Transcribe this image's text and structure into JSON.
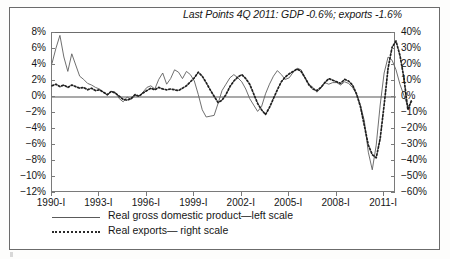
{
  "title": "Last Points 4Q 2011: GDP -0.6%; exports -1.6%",
  "legend": {
    "items": [
      {
        "label": "Real gross domestic product—left scale",
        "style": "solid"
      },
      {
        "label": "Real exports— right scale",
        "style": "dotted"
      }
    ]
  },
  "axes": {
    "left_ticks": [
      "8%",
      "6%",
      "4%",
      "2%",
      "0%",
      "-2%",
      "-4%",
      "-6%",
      "-8%",
      "-10%",
      "-12%"
    ],
    "right_ticks": [
      "40%",
      "30%",
      "20%",
      "10%",
      "0%",
      "-10%",
      "-20%",
      "-30%",
      "-40%",
      "-50%",
      "-60%"
    ],
    "x_ticks": [
      "1990-I",
      "1993-I",
      "1996-I",
      "1999-I",
      "2002-I",
      "2005-I",
      "2008-I",
      "2011-I"
    ]
  },
  "chart_data": {
    "type": "line",
    "title": "Last Points 4Q 2011: GDP -0.6%; exports -1.6%",
    "xlabel": "",
    "ylabel": "",
    "grid": false,
    "legend_position": "bottom-left",
    "x_tick_labels": [
      "1990-I",
      "1993-I",
      "1996-I",
      "1999-I",
      "2002-I",
      "2005-I",
      "2008-I",
      "2011-I"
    ],
    "x_tick_index": [
      0,
      12,
      24,
      36,
      48,
      60,
      72,
      84
    ],
    "x_start": "1990-I",
    "x_end": "2011-IV",
    "n_points": 88,
    "left_axis": {
      "label": "percent",
      "ylim": [
        -12,
        8
      ],
      "tick_step": 2,
      "tick_labels": [
        "8%",
        "6%",
        "4%",
        "2%",
        "0%",
        "-2%",
        "-4%",
        "-6%",
        "-8%",
        "-10%",
        "-12%"
      ]
    },
    "right_axis": {
      "label": "percent",
      "ylim": [
        -60,
        40
      ],
      "tick_step": 10,
      "tick_labels": [
        "40%",
        "30%",
        "20%",
        "10%",
        "0%",
        "-10%",
        "-20%",
        "-30%",
        "-40%",
        "-50%",
        "-60%"
      ]
    },
    "zero_line": 0,
    "annotations": [
      {
        "text": "Last Points 4Q 2011: GDP -0.6%; exports -1.6%",
        "position": "top-right"
      }
    ],
    "series": [
      {
        "name": "Real gross domestic product—left scale",
        "axis": "left",
        "style": "solid",
        "color": "#5a5a5a",
        "values": [
          4.2,
          6.1,
          7.7,
          5.0,
          3.2,
          5.4,
          4.0,
          2.6,
          2.2,
          1.7,
          1.5,
          1.2,
          1.0,
          0.6,
          0.2,
          0.7,
          0.6,
          -0.2,
          -0.6,
          0.0,
          -0.3,
          0.2,
          0.1,
          0.6,
          1.2,
          1.4,
          1.0,
          2.2,
          3.0,
          1.6,
          2.3,
          3.4,
          3.1,
          2.3,
          3.2,
          2.8,
          2.0,
          0.3,
          -1.6,
          -2.5,
          -2.4,
          -2.3,
          -0.8,
          0.8,
          1.6,
          2.4,
          2.8,
          2.4,
          1.9,
          1.0,
          -0.2,
          -1.0,
          -1.8,
          -1.2,
          0.4,
          1.6,
          2.6,
          3.3,
          2.8,
          2.2,
          2.4,
          3.1,
          3.6,
          3.4,
          2.4,
          1.6,
          1.2,
          0.6,
          1.1,
          1.8,
          1.6,
          1.8,
          1.8,
          1.5,
          1.9,
          1.7,
          1.2,
          0.4,
          -1.0,
          -3.0,
          -6.9,
          -9.1,
          -6.0,
          -1.0,
          3.0,
          5.0,
          4.6,
          3.4,
          1.6,
          0.2,
          -1.2,
          -0.6
        ]
      },
      {
        "name": "Real exports— right scale",
        "axis": "right",
        "style": "dotted",
        "color": "#2a2a2a",
        "values": [
          7.0,
          8.0,
          6.5,
          7.5,
          6.0,
          7.5,
          6.5,
          5.5,
          6.0,
          4.5,
          5.5,
          4.0,
          4.5,
          3.0,
          1.5,
          3.5,
          2.5,
          0.5,
          -1.5,
          -2.0,
          -1.0,
          1.5,
          0.5,
          2.5,
          4.0,
          5.5,
          4.5,
          6.0,
          5.0,
          4.5,
          5.0,
          4.5,
          4.0,
          5.5,
          7.0,
          9.5,
          12.0,
          15.5,
          13.0,
          9.0,
          4.5,
          0.5,
          -3.5,
          -2.0,
          1.5,
          6.5,
          10.0,
          12.5,
          14.0,
          11.5,
          8.0,
          2.0,
          -4.0,
          -8.0,
          -11.0,
          -6.5,
          -1.0,
          4.5,
          9.5,
          12.5,
          14.5,
          16.0,
          17.5,
          16.0,
          12.0,
          7.5,
          5.0,
          4.0,
          6.0,
          9.0,
          11.5,
          10.5,
          9.5,
          8.5,
          11.0,
          10.0,
          7.5,
          2.0,
          -6.0,
          -18.0,
          -30.0,
          -36.0,
          -38.0,
          -26.0,
          -5.0,
          18.0,
          31.0,
          35.0,
          26.0,
          12.0,
          -8.0,
          -1.6
        ]
      }
    ]
  }
}
